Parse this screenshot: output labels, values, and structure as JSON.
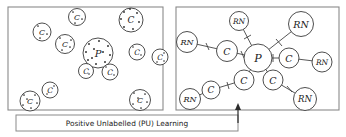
{
  "figure": {
    "caption": "Positive Unlabelled (PU) Learning",
    "panels": [
      {
        "name": "left-panel-unlabelled-pool",
        "id": "left",
        "frame": {
          "x": 8,
          "y": 7,
          "w": 155,
          "h": 103
        },
        "nodes": [
          {
            "label": "C",
            "cx": 42,
            "cy": 32,
            "r": 9.0,
            "dots": 3
          },
          {
            "label": "C",
            "cx": 77,
            "cy": 17,
            "r": 8.5,
            "dots": 3
          },
          {
            "label": "C",
            "cx": 131,
            "cy": 20,
            "r": 12.0,
            "dots": 7
          },
          {
            "label": "C",
            "cx": 65,
            "cy": 44,
            "r": 9.5,
            "dots": 4
          },
          {
            "label": "P",
            "cx": 98,
            "cy": 53,
            "r": 15.0,
            "dots": 11
          },
          {
            "label": "C",
            "cx": 137,
            "cy": 52,
            "r": 8.0,
            "dots": 2
          },
          {
            "label": "C",
            "cx": 160,
            "cy": 57,
            "r": 8.0,
            "dots": 3
          },
          {
            "label": "C",
            "cx": 86,
            "cy": 71,
            "r": 7.5,
            "dots": 1
          },
          {
            "label": "C",
            "cx": 110,
            "cy": 72,
            "r": 8.0,
            "dots": 2
          },
          {
            "label": "C",
            "cx": 50,
            "cy": 90,
            "r": 8.0,
            "dots": 2
          },
          {
            "label": "C",
            "cx": 30,
            "cy": 101,
            "r": 10.0,
            "dots": 6
          },
          {
            "label": "C",
            "cx": 140,
            "cy": 100,
            "r": 10.5,
            "dots": 6
          }
        ]
      },
      {
        "name": "right-panel-pu-graph",
        "id": "right",
        "frame": {
          "x": 176,
          "y": 7,
          "w": 163,
          "h": 103
        },
        "nodes": [
          {
            "label": "P",
            "cx": 258,
            "cy": 58,
            "r": 14.0,
            "role": "positive"
          },
          {
            "label": "C",
            "cx": 227,
            "cy": 51,
            "r": 10.5,
            "role": "classifier"
          },
          {
            "label": "C",
            "cx": 289,
            "cy": 58,
            "r": 10.0,
            "role": "classifier"
          },
          {
            "label": "C",
            "cx": 244,
            "cy": 80,
            "r": 10.0,
            "role": "classifier"
          },
          {
            "label": "C",
            "cx": 273,
            "cy": 80,
            "r": 10.0,
            "role": "classifier"
          },
          {
            "label": "C",
            "cx": 211,
            "cy": 90,
            "r": 9.0,
            "role": "classifier"
          },
          {
            "label": "RN",
            "cx": 187,
            "cy": 42,
            "r": 10.5,
            "role": "reliable-negative"
          },
          {
            "label": "RN",
            "cx": 239,
            "cy": 21,
            "r": 9.5,
            "role": "reliable-negative"
          },
          {
            "label": "RN",
            "cx": 301,
            "cy": 24,
            "r": 12.5,
            "role": "reliable-negative"
          },
          {
            "label": "RN",
            "cx": 322,
            "cy": 62,
            "r": 10.0,
            "role": "reliable-negative"
          },
          {
            "label": "RN",
            "cx": 190,
            "cy": 99,
            "r": 10.5,
            "role": "reliable-negative"
          },
          {
            "label": "RN",
            "cx": 305,
            "cy": 99,
            "r": 11.5,
            "role": "reliable-negative"
          }
        ],
        "edges": [
          {
            "from": "P",
            "to": "C1",
            "x1": 258,
            "y1": 58,
            "x2": 227,
            "y2": 51,
            "tick": true
          },
          {
            "from": "P",
            "to": "C2",
            "x1": 258,
            "y1": 58,
            "x2": 289,
            "y2": 58,
            "tick": true
          },
          {
            "from": "P",
            "to": "C3",
            "x1": 258,
            "y1": 58,
            "x2": 244,
            "y2": 80,
            "tick": true
          },
          {
            "from": "P",
            "to": "C4",
            "x1": 258,
            "y1": 58,
            "x2": 273,
            "y2": 80,
            "tick": true
          },
          {
            "from": "P",
            "to": "RNa",
            "x1": 258,
            "y1": 58,
            "x2": 239,
            "y2": 21,
            "tick": true
          },
          {
            "from": "P",
            "to": "RNb",
            "x1": 258,
            "y1": 58,
            "x2": 301,
            "y2": 24,
            "tick": true
          },
          {
            "from": "C1",
            "to": "RNc",
            "x1": 227,
            "y1": 51,
            "x2": 187,
            "y2": 42,
            "tick": true
          },
          {
            "from": "C2",
            "to": "RNd",
            "x1": 289,
            "y1": 58,
            "x2": 322,
            "y2": 62,
            "tick": false
          },
          {
            "from": "C3",
            "to": "C5",
            "x1": 244,
            "y1": 80,
            "x2": 211,
            "y2": 90,
            "tick": true
          },
          {
            "from": "C5",
            "to": "RNe",
            "x1": 211,
            "y1": 90,
            "x2": 190,
            "y2": 99,
            "tick": false
          },
          {
            "from": "C4",
            "to": "RNf",
            "x1": 273,
            "y1": 80,
            "x2": 305,
            "y2": 99,
            "tick": true
          }
        ]
      }
    ],
    "caption_box": {
      "x": 16,
      "y": 115,
      "w": 222,
      "h": 16
    },
    "arrow": {
      "x": 238,
      "y_from": 123,
      "y_to": 104
    }
  }
}
